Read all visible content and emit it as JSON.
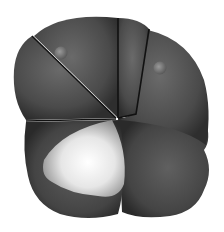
{
  "image": {
    "description": "3D rendered gray multi-lobed cell cluster with dark seam lines, two small highlight nubs and a bright white lobe at lower left",
    "colors": {
      "background": "#ffffff",
      "body": "#4a4a4a",
      "body_light": "#6a6a6a",
      "body_dark": "#2e2e2e",
      "seam": "#111111",
      "white_lobe": "#f2f2f2",
      "nub": "#8a8a8a"
    }
  }
}
